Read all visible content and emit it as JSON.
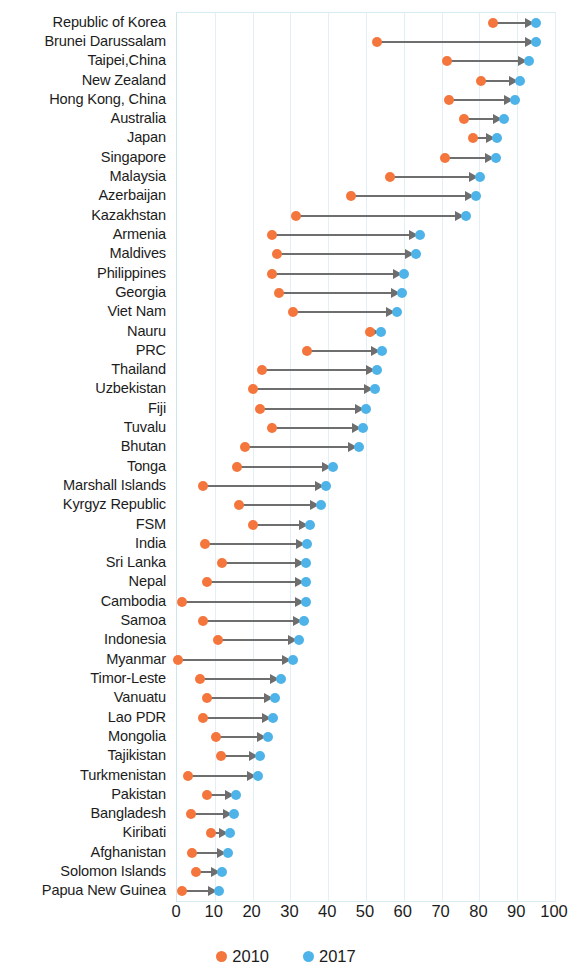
{
  "chart_data": {
    "type": "scatter",
    "title": "",
    "subtitle": "",
    "xlabel": "",
    "ylabel": "",
    "xlim": [
      0,
      100
    ],
    "xticks": [
      0,
      10,
      20,
      30,
      40,
      50,
      60,
      70,
      80,
      90,
      100
    ],
    "grid": true,
    "legend_position": "bottom-center",
    "colors": {
      "series_2010": "#f4763c",
      "series_2017": "#4eb3e8",
      "connector": "#6e6e6e",
      "gridline": "#e2f0f6",
      "plot_border": "#d9ecf3"
    },
    "legend": [
      {
        "label": "2010",
        "color": "#f4763c",
        "marker": "circle"
      },
      {
        "label": "2017",
        "color": "#4eb3e8",
        "marker": "circle"
      }
    ],
    "series": [
      {
        "name": "2010",
        "color": "#f4763c"
      },
      {
        "name": "2017",
        "color": "#4eb3e8"
      }
    ],
    "categories": [
      "Republic of Korea",
      "Brunei Darussalam",
      "Taipei,China",
      "New Zealand",
      "Hong Kong, China",
      "Australia",
      "Japan",
      "Singapore",
      "Malaysia",
      "Azerbaijan",
      "Kazakhstan",
      "Armenia",
      "Maldives",
      "Philippines",
      "Georgia",
      "Viet Nam",
      "Nauru",
      "PRC",
      "Thailand",
      "Uzbekistan",
      "Fiji",
      "Tuvalu",
      "Bhutan",
      "Tonga",
      "Marshall Islands",
      "Kyrgyz Republic",
      "FSM",
      "India",
      "Sri Lanka",
      "Nepal",
      "Cambodia",
      "Samoa",
      "Indonesia",
      "Myanmar",
      "Timor-Leste",
      "Vanuatu",
      "Lao PDR",
      "Mongolia",
      "Tajikistan",
      "Turkmenistan",
      "Pakistan",
      "Bangladesh",
      "Kiribati",
      "Afghanistan",
      "Solomon Islands",
      "Papua New Guinea"
    ],
    "rows": [
      {
        "category": "Republic of Korea",
        "v2010": 83.7,
        "v2017": 95.1
      },
      {
        "category": "Brunei Darussalam",
        "v2010": 53.0,
        "v2017": 94.9
      },
      {
        "category": "Taipei,China",
        "v2010": 71.5,
        "v2017": 93.0
      },
      {
        "category": "New Zealand",
        "v2010": 80.5,
        "v2017": 90.8
      },
      {
        "category": "Hong Kong, China",
        "v2010": 72.0,
        "v2017": 89.4
      },
      {
        "category": "Australia",
        "v2010": 76.0,
        "v2017": 86.5
      },
      {
        "category": "Japan",
        "v2010": 78.2,
        "v2017": 84.6
      },
      {
        "category": "Singapore",
        "v2010": 71.0,
        "v2017": 84.5
      },
      {
        "category": "Malaysia",
        "v2010": 56.3,
        "v2017": 80.1
      },
      {
        "category": "Azerbaijan",
        "v2010": 46.0,
        "v2017": 79.0
      },
      {
        "category": "Kazakhstan",
        "v2010": 31.6,
        "v2017": 76.4
      },
      {
        "category": "Armenia",
        "v2010": 25.0,
        "v2017": 64.3
      },
      {
        "category": "Maldives",
        "v2010": 26.5,
        "v2017": 63.2
      },
      {
        "category": "Philippines",
        "v2010": 25.0,
        "v2017": 60.1
      },
      {
        "category": "Georgia",
        "v2010": 26.9,
        "v2017": 59.6
      },
      {
        "category": "Viet Nam",
        "v2010": 30.7,
        "v2017": 58.1
      },
      {
        "category": "Nauru",
        "v2010": 51.0,
        "v2017": 54.0
      },
      {
        "category": "PRC",
        "v2010": 34.3,
        "v2017": 54.3
      },
      {
        "category": "Thailand",
        "v2010": 22.4,
        "v2017": 52.9
      },
      {
        "category": "Uzbekistan",
        "v2010": 20.0,
        "v2017": 52.3
      },
      {
        "category": "Fiji",
        "v2010": 22.0,
        "v2017": 50.0
      },
      {
        "category": "Tuvalu",
        "v2010": 25.0,
        "v2017": 49.3
      },
      {
        "category": "Bhutan",
        "v2010": 18.0,
        "v2017": 48.1
      },
      {
        "category": "Tonga",
        "v2010": 16.0,
        "v2017": 41.2
      },
      {
        "category": "Marshall Islands",
        "v2010": 7.0,
        "v2017": 39.5
      },
      {
        "category": "Kyrgyz Republic",
        "v2010": 16.3,
        "v2017": 38.2
      },
      {
        "category": "FSM",
        "v2010": 20.0,
        "v2017": 35.2
      },
      {
        "category": "India",
        "v2010": 7.5,
        "v2017": 34.5
      },
      {
        "category": "Sri Lanka",
        "v2010": 12.0,
        "v2017": 34.1
      },
      {
        "category": "Nepal",
        "v2010": 7.9,
        "v2017": 34.0
      },
      {
        "category": "Cambodia",
        "v2010": 1.3,
        "v2017": 34.0
      },
      {
        "category": "Samoa",
        "v2010": 7.0,
        "v2017": 33.6
      },
      {
        "category": "Indonesia",
        "v2010": 10.9,
        "v2017": 32.3
      },
      {
        "category": "Myanmar",
        "v2010": 0.3,
        "v2017": 30.7
      },
      {
        "category": "Timor-Leste",
        "v2010": 6.2,
        "v2017": 27.5
      },
      {
        "category": "Vanuatu",
        "v2010": 8.0,
        "v2017": 26.0
      },
      {
        "category": "Lao PDR",
        "v2010": 7.0,
        "v2017": 25.5
      },
      {
        "category": "Mongolia",
        "v2010": 10.2,
        "v2017": 24.0
      },
      {
        "category": "Tajikistan",
        "v2010": 11.6,
        "v2017": 22.0
      },
      {
        "category": "Turkmenistan",
        "v2010": 3.0,
        "v2017": 21.3
      },
      {
        "category": "Pakistan",
        "v2010": 8.0,
        "v2017": 15.5
      },
      {
        "category": "Bangladesh",
        "v2010": 3.7,
        "v2017": 15.0
      },
      {
        "category": "Kiribati",
        "v2010": 9.0,
        "v2017": 14.0
      },
      {
        "category": "Afghanistan",
        "v2010": 4.0,
        "v2017": 13.5
      },
      {
        "category": "Solomon Islands",
        "v2010": 5.0,
        "v2017": 11.9
      },
      {
        "category": "Papua New Guinea",
        "v2010": 1.3,
        "v2017": 11.2
      }
    ]
  }
}
